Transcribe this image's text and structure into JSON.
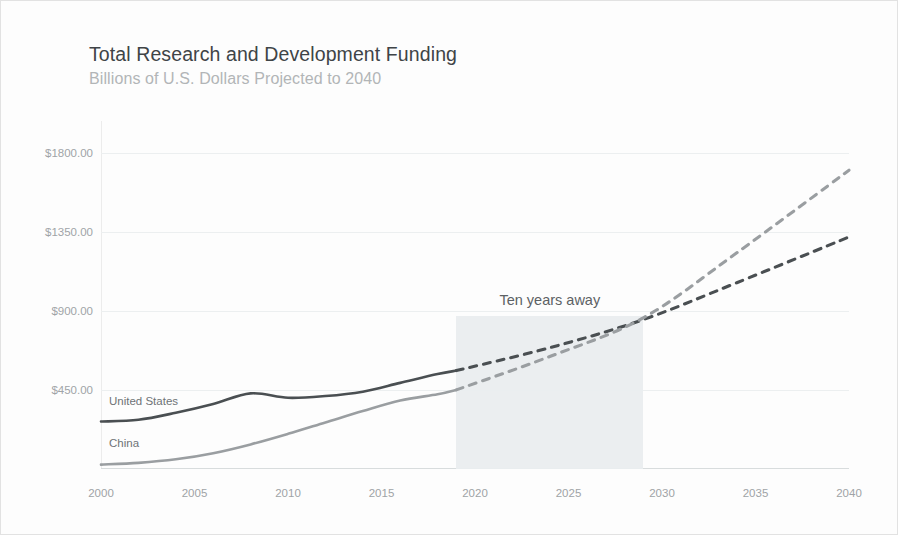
{
  "header": {
    "title": "Total Research and Development Funding",
    "subtitle": "Billions of U.S. Dollars Projected to 2040"
  },
  "annotation": {
    "band_label": "Ten years away",
    "band_start_year": 2019,
    "band_end_year": 2029
  },
  "series_labels": {
    "united_states": "United States",
    "china": "China"
  },
  "colors": {
    "united_states": "#4a4f52",
    "china": "#9a9ea1",
    "band": "#eaedef",
    "grid": "#eceff0",
    "title": "#3f4447",
    "subtitle": "#b2b5b7",
    "tick": "#a0a4a7"
  },
  "chart_data": {
    "type": "line",
    "title": "Total Research and Development Funding",
    "subtitle": "Billions of U.S. Dollars Projected to 2040",
    "xlabel": "",
    "ylabel": "Billions of U.S. Dollars",
    "xlim": [
      2000,
      2040
    ],
    "ylim": [
      0,
      1980
    ],
    "ytick_values": [
      450,
      900,
      1350,
      1800
    ],
    "ytick_labels": [
      "$450.00",
      "$900.00",
      "$1350.00",
      "$1800.00"
    ],
    "xtick_labels": [
      "2000",
      "2005",
      "2010",
      "2015",
      "2020",
      "2025",
      "2030",
      "2035",
      "2040"
    ],
    "grid": true,
    "legend": "inline-labels",
    "projection_start_year": 2019,
    "shaded_band": {
      "label": "Ten years away",
      "from": 2019,
      "to": 2029
    },
    "series": [
      {
        "name": "United States",
        "color": "#4a4f52",
        "x": [
          2000,
          2002,
          2004,
          2006,
          2008,
          2010,
          2012,
          2014,
          2016,
          2018,
          2019,
          2024,
          2029,
          2034,
          2040
        ],
        "values": [
          270,
          280,
          320,
          370,
          430,
          405,
          415,
          440,
          490,
          540,
          560,
          690,
          850,
          1060,
          1320
        ],
        "solid_through": 2019,
        "style_after": "dashed"
      },
      {
        "name": "China",
        "color": "#9a9ea1",
        "x": [
          2000,
          2002,
          2004,
          2006,
          2008,
          2010,
          2012,
          2014,
          2016,
          2018,
          2019,
          2024,
          2029,
          2034,
          2040
        ],
        "values": [
          25,
          35,
          55,
          90,
          140,
          200,
          265,
          330,
          390,
          425,
          450,
          640,
          860,
          1230,
          1700
        ],
        "solid_through": 2019,
        "style_after": "dashed"
      }
    ]
  }
}
